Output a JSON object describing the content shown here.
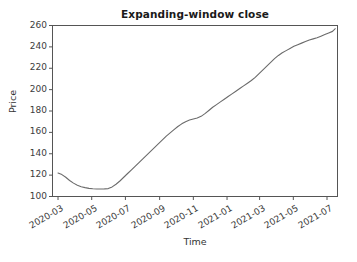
{
  "figure": {
    "background_color": "#ffffff",
    "axes_color": "#555555",
    "text_color": "#333333"
  },
  "chart_data": {
    "type": "line",
    "title": "Expanding-window close",
    "xlabel": "Time",
    "ylabel": "Price",
    "grid": false,
    "legend": "none",
    "line_color": "#6b6b6b",
    "line_width": 1.1,
    "ylim": [
      100,
      260
    ],
    "yticks": [
      100,
      120,
      140,
      160,
      180,
      200,
      220,
      240,
      260
    ],
    "ytick_labels": [
      "100",
      "120",
      "140",
      "160",
      "180",
      "200",
      "220",
      "240",
      "260"
    ],
    "xticks": [
      "2020-03",
      "2020-05",
      "2020-07",
      "2020-09",
      "2020-11",
      "2021-01",
      "2021-03",
      "2021-05",
      "2021-07"
    ],
    "xtick_labels": [
      "2020-03",
      "2020-05",
      "2020-07",
      "2020-09",
      "2020-11",
      "2021-01",
      "2021-03",
      "2021-05",
      "2021-07"
    ],
    "xlim": [
      "2020-02-20",
      "2021-07-20"
    ],
    "series": [
      {
        "name": "Expanding-window close",
        "x": [
          "2020-03-01",
          "2020-03-08",
          "2020-03-15",
          "2020-03-22",
          "2020-03-29",
          "2020-04-05",
          "2020-04-12",
          "2020-04-19",
          "2020-04-26",
          "2020-05-03",
          "2020-05-10",
          "2020-05-17",
          "2020-05-24",
          "2020-05-31",
          "2020-06-07",
          "2020-06-14",
          "2020-06-21",
          "2020-06-28",
          "2020-07-05",
          "2020-07-12",
          "2020-07-19",
          "2020-07-26",
          "2020-08-02",
          "2020-08-09",
          "2020-08-16",
          "2020-08-23",
          "2020-08-30",
          "2020-09-06",
          "2020-09-13",
          "2020-09-20",
          "2020-09-27",
          "2020-10-04",
          "2020-10-11",
          "2020-10-18",
          "2020-10-25",
          "2020-11-01",
          "2020-11-08",
          "2020-11-15",
          "2020-11-22",
          "2020-11-29",
          "2020-12-06",
          "2020-12-13",
          "2020-12-20",
          "2020-12-27",
          "2021-01-03",
          "2021-01-10",
          "2021-01-17",
          "2021-01-24",
          "2021-01-31",
          "2021-02-07",
          "2021-02-14",
          "2021-02-21",
          "2021-02-28",
          "2021-03-07",
          "2021-03-14",
          "2021-03-21",
          "2021-03-28",
          "2021-04-04",
          "2021-04-11",
          "2021-04-18",
          "2021-04-25",
          "2021-05-02",
          "2021-05-09",
          "2021-05-16",
          "2021-05-23",
          "2021-05-30",
          "2021-06-06",
          "2021-06-13",
          "2021-06-20",
          "2021-06-27",
          "2021-07-04",
          "2021-07-11",
          "2021-07-16"
        ],
        "values": [
          122.0,
          120.5,
          118.0,
          115.0,
          112.5,
          110.5,
          109.2,
          108.3,
          107.6,
          107.2,
          107.0,
          107.0,
          107.1,
          107.4,
          109.0,
          111.5,
          114.5,
          118.0,
          121.5,
          125.0,
          128.5,
          132.0,
          135.5,
          139.0,
          142.5,
          146.0,
          149.5,
          153.0,
          156.5,
          159.5,
          162.5,
          165.5,
          168.0,
          170.0,
          171.5,
          172.5,
          173.5,
          175.0,
          177.5,
          180.5,
          183.5,
          186.0,
          188.5,
          191.0,
          193.5,
          196.0,
          198.5,
          201.0,
          203.5,
          206.0,
          208.5,
          211.5,
          215.0,
          218.5,
          222.0,
          225.5,
          229.0,
          232.0,
          234.5,
          236.5,
          238.5,
          240.5,
          242.0,
          243.5,
          245.0,
          246.5,
          247.5,
          248.5,
          250.0,
          251.5,
          253.0,
          254.5,
          257.0
        ]
      }
    ]
  }
}
